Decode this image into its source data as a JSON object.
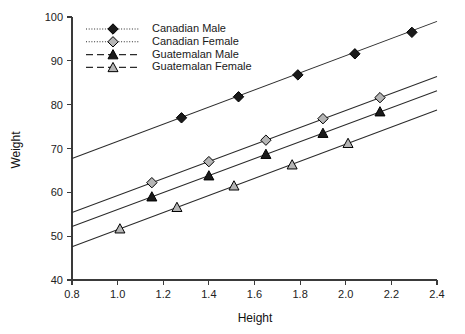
{
  "chart_data": {
    "type": "scatter",
    "title": "",
    "xlabel": "Height",
    "ylabel": "Weight",
    "xlim": [
      0.8,
      2.4
    ],
    "ylim": [
      40,
      100
    ],
    "xticks": [
      "0.8",
      "1.0",
      "1.2",
      "1.4",
      "1.6",
      "1.8",
      "2.0",
      "2.2",
      "2.4"
    ],
    "xtick_values": [
      0.8,
      1.0,
      1.2,
      1.4,
      1.6,
      1.8,
      2.0,
      2.2,
      2.4
    ],
    "yticks": [
      "40",
      "50",
      "60",
      "70",
      "80",
      "90",
      "100"
    ],
    "ytick_values": [
      40,
      50,
      60,
      70,
      80,
      90,
      100
    ],
    "grid": false,
    "legend_position": "top-left-inside",
    "series": [
      {
        "name": "Canadian Male",
        "marker": "filled-diamond",
        "linestyle": "dotted",
        "marker_fill": "#1a1a1a",
        "marker_stroke": "#000000",
        "line_color": "#2b2b2b",
        "x": [
          1.28,
          1.53,
          1.79,
          2.04,
          2.29
        ],
        "y": [
          77.0,
          81.8,
          86.8,
          91.6,
          96.5
        ],
        "fit_x": [
          0.8,
          2.4
        ],
        "fit_y": [
          67.7,
          99.0
        ]
      },
      {
        "name": "Canadian Female",
        "marker": "open-diamond",
        "linestyle": "dotted",
        "marker_fill": "#b5b5b5",
        "marker_stroke": "#000000",
        "line_color": "#2b2b2b",
        "x": [
          1.15,
          1.4,
          1.65,
          1.9,
          2.15
        ],
        "y": [
          62.2,
          67.0,
          71.9,
          76.8,
          81.6
        ],
        "fit_x": [
          0.8,
          2.4
        ],
        "fit_y": [
          55.4,
          86.4
        ]
      },
      {
        "name": "Guatemalan Male",
        "marker": "filled-triangle",
        "linestyle": "dashed",
        "marker_fill": "#1a1a1a",
        "marker_stroke": "#000000",
        "line_color": "#2b2b2b",
        "x": [
          1.15,
          1.4,
          1.65,
          1.9,
          2.15
        ],
        "y": [
          59.0,
          63.8,
          68.7,
          73.5,
          78.4
        ],
        "fit_x": [
          0.8,
          2.4
        ],
        "fit_y": [
          52.2,
          83.2
        ]
      },
      {
        "name": "Guatemalan Female",
        "marker": "open-triangle",
        "linestyle": "dashed",
        "marker_fill": "#b5b5b5",
        "marker_stroke": "#000000",
        "line_color": "#2b2b2b",
        "x": [
          1.01,
          1.26,
          1.51,
          1.765,
          2.01
        ],
        "y": [
          51.7,
          56.6,
          61.5,
          66.3,
          71.2
        ],
        "fit_x": [
          0.8,
          2.4
        ],
        "fit_y": [
          47.6,
          78.8
        ]
      }
    ]
  },
  "colors": {
    "axis": "#3a3a3a",
    "line": "#2b2b2b",
    "text": "#111111",
    "open_marker_fill": "#b5b5b5",
    "filled_marker": "#1a1a1a",
    "background": "#ffffff"
  }
}
